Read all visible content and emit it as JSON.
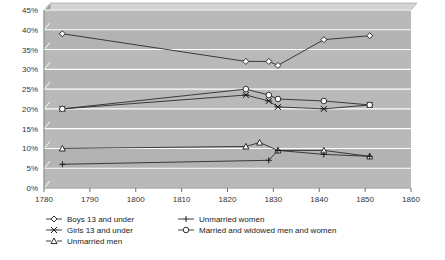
{
  "chart_data": {
    "type": "line",
    "title": "",
    "xlabel": "",
    "ylabel": "",
    "xlim": [
      1780,
      1860
    ],
    "ylim": [
      0,
      45
    ],
    "grid": true,
    "legend_position": "bottom",
    "xticks": [
      "1780",
      "1790",
      "1800",
      "1810",
      "1820",
      "1830",
      "1840",
      "1850",
      "1860"
    ],
    "yticks": [
      "0%",
      "5%",
      "10%",
      "15%",
      "20%",
      "25%",
      "30%",
      "35%",
      "40%",
      "45%"
    ],
    "series": [
      {
        "name": "Boys 13 and under",
        "marker": "diamond",
        "x": [
          1784,
          1824,
          1829,
          1831,
          1841,
          1851
        ],
        "values": [
          39.0,
          32.0,
          32.0,
          31.0,
          37.5,
          38.5
        ]
      },
      {
        "name": "Girls 13 and under",
        "marker": "x",
        "x": [
          1784,
          1824,
          1829,
          1831,
          1841,
          1851
        ],
        "values": [
          20.0,
          23.5,
          22.0,
          20.5,
          20.0,
          21.0
        ]
      },
      {
        "name": "Unmarried men",
        "marker": "triangle",
        "x": [
          1784,
          1824,
          1827,
          1831,
          1841,
          1851
        ],
        "values": [
          10.0,
          10.5,
          11.5,
          9.5,
          9.5,
          8.0
        ]
      },
      {
        "name": "Unmarried women",
        "marker": "plus",
        "x": [
          1784,
          1829,
          1831,
          1841,
          1851
        ],
        "values": [
          6.0,
          7.0,
          9.5,
          8.5,
          8.0
        ]
      },
      {
        "name": "Married and widowed men and women",
        "marker": "circle",
        "x": [
          1784,
          1824,
          1829,
          1831,
          1841,
          1851
        ],
        "values": [
          20.0,
          25.0,
          23.5,
          22.5,
          22.0,
          21.0
        ]
      }
    ]
  },
  "legend": {
    "items": [
      {
        "label": "Boys 13 and under",
        "marker": "diamond",
        "column": 0
      },
      {
        "label": "Girls 13 and under",
        "marker": "x",
        "column": 0
      },
      {
        "label": "Unmarried men",
        "marker": "triangle",
        "column": 0
      },
      {
        "label": "Unmarried women",
        "marker": "plus",
        "column": 1
      },
      {
        "label": "Married and widowed men and women",
        "marker": "circle",
        "column": 1
      }
    ]
  },
  "colors": {
    "plot_background": "#b3b3b3",
    "plot_background_light": "#bdbdbd",
    "gridline": "#ffffff",
    "line": "#2b2b2b",
    "marker_fill": "#ffffff",
    "text": "#333333",
    "page_background": "#ffffff"
  }
}
